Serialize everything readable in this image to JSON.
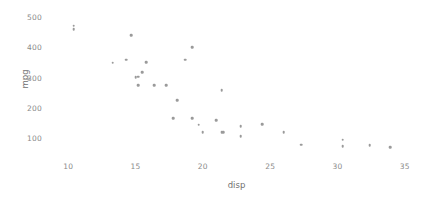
{
  "chart_data": {
    "type": "scatter",
    "title": "",
    "xlabel": "disp",
    "ylabel": "mpg",
    "xlim": [
      8.5,
      36.5
    ],
    "ylim": [
      55,
      530
    ],
    "grid": false,
    "legend": null,
    "marker": {
      "shape": "circle",
      "color": "#9a9a9a",
      "size": 2.6
    },
    "xticks": [
      10,
      15,
      20,
      25,
      30,
      35
    ],
    "yticks": [
      100,
      200,
      300,
      400,
      500
    ],
    "xtick_labels": [
      "10",
      "15",
      "20",
      "25",
      "30",
      "35"
    ],
    "ytick_labels": [
      "100",
      "200",
      "300",
      "400",
      "500"
    ],
    "n_points": 32,
    "points": [
      {
        "x": 10.4,
        "y": 472
      },
      {
        "x": 10.4,
        "y": 460
      },
      {
        "x": 13.3,
        "y": 350
      },
      {
        "x": 14.3,
        "y": 360
      },
      {
        "x": 14.7,
        "y": 440
      },
      {
        "x": 15.0,
        "y": 301
      },
      {
        "x": 15.2,
        "y": 304
      },
      {
        "x": 15.2,
        "y": 275
      },
      {
        "x": 15.5,
        "y": 318
      },
      {
        "x": 15.8,
        "y": 351
      },
      {
        "x": 16.4,
        "y": 275
      },
      {
        "x": 17.3,
        "y": 275
      },
      {
        "x": 17.8,
        "y": 167
      },
      {
        "x": 18.1,
        "y": 225
      },
      {
        "x": 18.7,
        "y": 360
      },
      {
        "x": 19.2,
        "y": 400
      },
      {
        "x": 19.2,
        "y": 167
      },
      {
        "x": 19.7,
        "y": 145
      },
      {
        "x": 20.0,
        "y": 120
      },
      {
        "x": 21.0,
        "y": 160
      },
      {
        "x": 21.4,
        "y": 258
      },
      {
        "x": 21.4,
        "y": 121
      },
      {
        "x": 21.5,
        "y": 120
      },
      {
        "x": 22.8,
        "y": 108
      },
      {
        "x": 22.8,
        "y": 141
      },
      {
        "x": 24.4,
        "y": 147
      },
      {
        "x": 26.0,
        "y": 120
      },
      {
        "x": 27.3,
        "y": 79
      },
      {
        "x": 30.4,
        "y": 95
      },
      {
        "x": 30.4,
        "y": 75
      },
      {
        "x": 32.4,
        "y": 78
      },
      {
        "x": 33.9,
        "y": 71
      }
    ]
  }
}
